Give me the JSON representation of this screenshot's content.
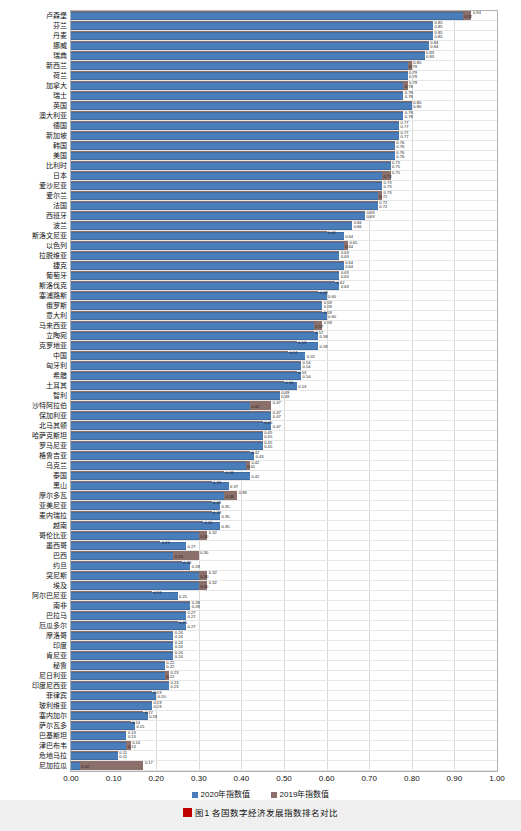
{
  "chart_data": {
    "type": "bar",
    "title": "",
    "xlabel": "",
    "ylabel": "",
    "xlim": [
      0.0,
      1.0
    ],
    "grid": true,
    "orientation": "horizontal",
    "legend_position": "bottom",
    "xticks": [
      "0.00",
      "0.10",
      "0.20",
      "0.30",
      "0.40",
      "0.50",
      "0.60",
      "0.70",
      "0.80",
      "0.90",
      "1.00"
    ],
    "series": [
      {
        "name": "2020年指数值",
        "color": "#4a7ebb"
      },
      {
        "name": "2019年指数值",
        "color": "#8b6f6a"
      }
    ],
    "categories": [
      "卢森堡",
      "芬兰",
      "丹麦",
      "挪威",
      "瑞典",
      "新西兰",
      "荷兰",
      "加拿大",
      "瑞士",
      "英国",
      "澳大利亚",
      "德国",
      "新加坡",
      "韩国",
      "美国",
      "比利时",
      "日本",
      "爱沙尼亚",
      "爱尔兰",
      "法国",
      "西班牙",
      "波兰",
      "斯洛文尼亚",
      "以色列",
      "拉脱维亚",
      "捷克",
      "葡萄牙",
      "斯洛伐克",
      "塞浦路斯",
      "俄罗斯",
      "意大利",
      "马来西亚",
      "立陶宛",
      "克罗地亚",
      "中国",
      "匈牙利",
      "希腊",
      "土耳其",
      "智利",
      "沙特阿拉伯",
      "保加利亚",
      "北马其顿",
      "哈萨克斯坦",
      "罗马尼亚",
      "格鲁吉亚",
      "乌克兰",
      "泰国",
      "黑山",
      "摩尔多瓦",
      "亚美尼亚",
      "麦内瑞拉",
      "越南",
      "哥伦比亚",
      "墨西哥",
      "巴西",
      "约旦",
      "突尼斯",
      "埃及",
      "阿尔巴尼亚",
      "南非",
      "巴拉马",
      "厄瓜多尔",
      "摩洛哥",
      "印度",
      "肯尼亚",
      "秘鲁",
      "尼日利亚",
      "印度尼西亚",
      "菲律宾",
      "玻利维亚",
      "塞内加尔",
      "萨尔瓦多",
      "巴基斯坦",
      "津巴布韦",
      "危地马拉",
      "尼加拉瓜"
    ],
    "values_2020": [
      0.92,
      0.85,
      0.85,
      0.84,
      0.83,
      0.79,
      0.79,
      0.78,
      0.78,
      0.8,
      0.78,
      0.77,
      0.77,
      0.76,
      0.76,
      0.75,
      0.73,
      0.73,
      0.72,
      0.72,
      0.69,
      0.66,
      0.64,
      0.64,
      0.63,
      0.64,
      0.63,
      0.63,
      0.6,
      0.59,
      0.6,
      0.57,
      0.58,
      0.58,
      0.55,
      0.54,
      0.54,
      0.53,
      0.49,
      0.42,
      0.47,
      0.47,
      0.45,
      0.45,
      0.43,
      0.41,
      0.42,
      0.37,
      0.36,
      0.35,
      0.35,
      0.35,
      0.3,
      0.27,
      0.24,
      0.28,
      0.3,
      0.3,
      0.25,
      0.28,
      0.27,
      0.27,
      0.24,
      0.24,
      0.24,
      0.22,
      0.22,
      0.23,
      0.2,
      0.19,
      0.18,
      0.15,
      0.13,
      0.13,
      0.11,
      0.02
    ],
    "values_2019": [
      0.94,
      0.85,
      0.85,
      0.84,
      0.83,
      0.8,
      0.79,
      0.79,
      0.78,
      0.8,
      0.78,
      0.77,
      0.77,
      0.76,
      0.76,
      0.75,
      0.75,
      0.73,
      0.73,
      0.72,
      0.69,
      0.66,
      0.6,
      0.65,
      0.63,
      0.64,
      0.63,
      0.62,
      0.58,
      0.59,
      0.59,
      0.59,
      0.57,
      0.53,
      0.51,
      0.54,
      0.53,
      0.5,
      0.49,
      0.47,
      0.47,
      0.45,
      0.45,
      0.45,
      0.42,
      0.42,
      0.36,
      0.33,
      0.39,
      0.33,
      0.33,
      0.31,
      0.32,
      0.21,
      0.3,
      0.26,
      0.32,
      0.32,
      0.19,
      0.28,
      0.27,
      0.25,
      0.24,
      0.24,
      0.24,
      0.22,
      0.23,
      0.23,
      0.19,
      0.19,
      0.17,
      0.14,
      0.13,
      0.14,
      0.11,
      0.17
    ]
  },
  "legend": {
    "item2020": "2020年指数值",
    "item2019": "2019年指数值"
  },
  "caption": "图1 各国数字经济发展指数排名对比"
}
